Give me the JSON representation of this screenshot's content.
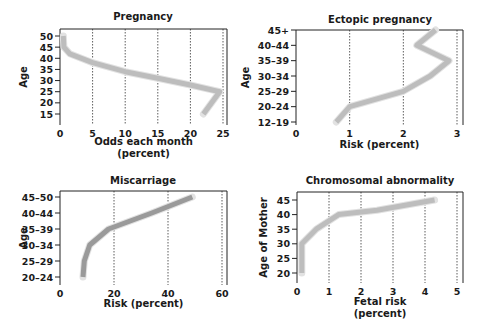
{
  "line_color": "#bdbdbd",
  "line_color_dark": "#9a9a9a",
  "chart_data": [
    {
      "type": "line",
      "title": "Pregnancy",
      "xlabel": "Odds each month",
      "xlabel2": "(percent)",
      "ylabel": "Age",
      "xlim": [
        0,
        25
      ],
      "ylim": [
        15,
        50
      ],
      "x_ticks": [
        "0",
        "5",
        "10",
        "15",
        "20",
        "25"
      ],
      "y_ticks": [
        "15",
        "20",
        "25",
        "30",
        "35",
        "40",
        "45",
        "50"
      ],
      "grid": "vertical dotted",
      "series": [
        {
          "name": "Odds each month",
          "x": [
            0.5,
            0.6,
            1.5,
            5,
            10,
            15,
            20,
            24.5,
            22
          ],
          "y": [
            50,
            45,
            42,
            38,
            34,
            31,
            28,
            25,
            15
          ]
        }
      ]
    },
    {
      "type": "line",
      "title": "Ectopic pregnancy",
      "xlabel": "Risk (percent)",
      "xlabel2": "",
      "ylabel": "Age",
      "xlim": [
        0,
        3
      ],
      "categories": [
        "12–19",
        "20–24",
        "25–29",
        "30–34",
        "35–39",
        "40–44",
        "45+"
      ],
      "x_ticks": [
        "0",
        "1",
        "2",
        "3"
      ],
      "grid": "vertical dotted",
      "series": [
        {
          "name": "Risk",
          "x": [
            0.75,
            1.0,
            2.0,
            2.5,
            2.85,
            2.25,
            2.6
          ],
          "y": [
            "12–19",
            "20–24",
            "25–29",
            "30–34",
            "35–39",
            "40–44",
            "45+"
          ]
        }
      ]
    },
    {
      "type": "line",
      "title": "Miscarriage",
      "xlabel": "Risk (percent)",
      "xlabel2": "",
      "ylabel": "Age",
      "xlim": [
        0,
        60
      ],
      "categories": [
        "20–24",
        "25–29",
        "30–34",
        "35–39",
        "40–44",
        "45–50"
      ],
      "x_ticks": [
        "0",
        "20",
        "40",
        "60"
      ],
      "grid": "vertical dotted",
      "series": [
        {
          "name": "Risk",
          "x": [
            8.5,
            9,
            11,
            18,
            34,
            49
          ],
          "y": [
            "20–24",
            "25–29",
            "30–34",
            "35–39",
            "40–44",
            "45–50"
          ]
        }
      ]
    },
    {
      "type": "line",
      "title": "Chromosomal abnormality",
      "xlabel": "Fetal risk",
      "xlabel2": "(percent)",
      "ylabel": "Age of Mother",
      "xlim": [
        0,
        5
      ],
      "ylim": [
        20,
        45
      ],
      "x_ticks": [
        "0",
        "1",
        "2",
        "3",
        "4",
        "5"
      ],
      "y_ticks": [
        "20",
        "25",
        "30",
        "35",
        "40",
        "45"
      ],
      "grid": "vertical dotted",
      "series": [
        {
          "name": "Fetal risk",
          "x": [
            0.15,
            0.15,
            0.6,
            1.3,
            2.5,
            4.3
          ],
          "y": [
            20,
            30,
            35,
            40,
            41.5,
            45
          ]
        }
      ]
    }
  ]
}
